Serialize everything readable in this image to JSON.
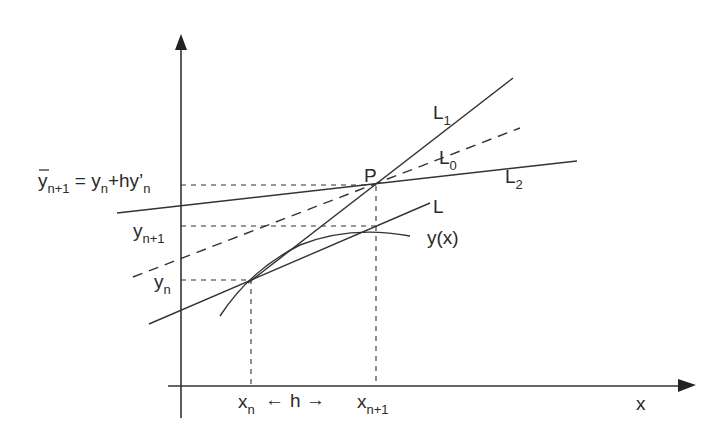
{
  "figure": {
    "axes": {
      "x_label": "x",
      "y_label": ""
    },
    "x_ticks": [
      {
        "base": "x",
        "sub": "n"
      },
      {
        "base": "x",
        "sub": "n+1"
      }
    ],
    "step_label": "h",
    "step_arrow_left": "←",
    "step_arrow_right": "→",
    "y_ticks": {
      "euler_predict": {
        "bar": "y",
        "sub": "n+1",
        "eq": " = y",
        "sub2": "n",
        "plus": "+hy’",
        "sub3": "n"
      },
      "y_next": {
        "base": "y",
        "sub": "n+1"
      },
      "y_n": {
        "base": "y",
        "sub": "n"
      }
    },
    "lines": {
      "L1": {
        "base": "L",
        "sub": "1"
      },
      "L0": {
        "base": "L",
        "sub": "0"
      },
      "L2": {
        "base": "L",
        "sub": "2"
      },
      "L": {
        "base": "L",
        "sub": ""
      }
    },
    "curve_label": "y(x)",
    "point_label": "P"
  }
}
